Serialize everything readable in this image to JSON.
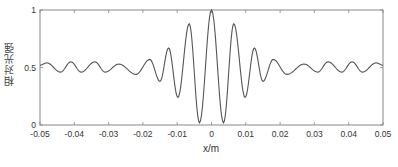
{
  "chart_data": {
    "type": "line",
    "title": "",
    "xlabel": "x/m",
    "ylabel": "相对光强",
    "xlim": [
      -0.05,
      0.05
    ],
    "ylim": [
      0,
      1
    ],
    "grid": false,
    "legend": null,
    "xticks": [
      -0.05,
      -0.04,
      -0.03,
      -0.02,
      -0.01,
      0,
      0.01,
      0.02,
      0.03,
      0.04,
      0.05
    ],
    "xtick_labels": [
      "-0.05",
      "-0.04",
      "-0.03",
      "-0.02",
      "-0.01",
      "0",
      "0.01",
      "0.02",
      "0.03",
      "0.04",
      "0.05"
    ],
    "yticks": [
      0,
      0.5,
      1
    ],
    "ytick_labels": [
      "0",
      "0.5",
      "1"
    ],
    "series": [
      {
        "name": "relative intensity",
        "color": "#555555",
        "x": [
          -0.05,
          -0.048,
          -0.044,
          -0.041,
          -0.038,
          -0.034,
          -0.031,
          -0.027,
          -0.022,
          -0.018,
          -0.015,
          -0.0125,
          -0.0098,
          -0.0065,
          -0.0035,
          0,
          0.0035,
          0.0065,
          0.0098,
          0.0125,
          0.015,
          0.018,
          0.022,
          0.027,
          0.031,
          0.034,
          0.038,
          0.041,
          0.044,
          0.048,
          0.05
        ],
        "y": [
          0.52,
          0.54,
          0.46,
          0.55,
          0.46,
          0.55,
          0.46,
          0.53,
          0.44,
          0.57,
          0.38,
          0.67,
          0.24,
          0.88,
          0.02,
          1.0,
          0.02,
          0.88,
          0.24,
          0.67,
          0.38,
          0.57,
          0.44,
          0.53,
          0.46,
          0.55,
          0.46,
          0.55,
          0.46,
          0.54,
          0.52
        ]
      }
    ]
  },
  "axes": {
    "xlabel": "x/m",
    "ylabel": "相对光强"
  },
  "colors": {
    "line": "#555555",
    "frame": "#888888",
    "text": "#333333"
  }
}
